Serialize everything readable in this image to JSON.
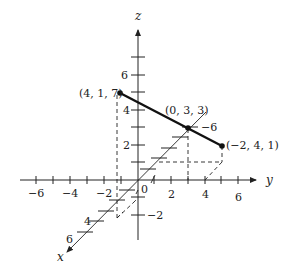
{
  "diagram": {
    "type": "3d-coordinate-plot",
    "axes": {
      "x": {
        "label": "x",
        "tick_labels": [
          "4",
          "6"
        ]
      },
      "y": {
        "label": "y",
        "tick_labels": [
          "−6",
          "−4",
          "−2",
          "2",
          "4",
          "6"
        ]
      },
      "z": {
        "label": "z",
        "tick_labels": [
          "6",
          "4",
          "2",
          "−2"
        ]
      },
      "origin_label": "0",
      "extra_label": "−6"
    },
    "points": [
      {
        "label": "(4, 1, 7)",
        "coords": [
          4,
          1,
          7
        ]
      },
      {
        "label": "(0, 3, 3)",
        "coords": [
          0,
          3,
          3
        ]
      },
      {
        "label": "(−2, 4, 1)",
        "coords": [
          -2,
          4,
          1
        ]
      }
    ],
    "segment": {
      "from": "(4, 1, 7)",
      "to": "(−2, 4, 1)",
      "through": "(0, 3, 3)"
    },
    "colors": {
      "ink": "#222222",
      "background": "#ffffff"
    }
  }
}
